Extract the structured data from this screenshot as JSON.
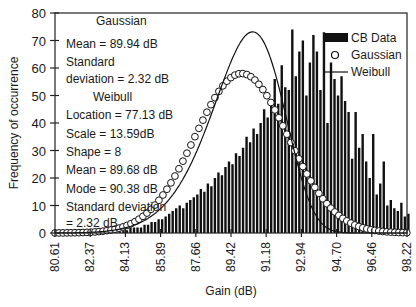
{
  "chart_data": {
    "type": "bar",
    "title": "",
    "xlabel": "Gain (dB)",
    "ylabel": "Frequency of occurrence",
    "xlim": [
      80.61,
      98.22
    ],
    "ylim": [
      0,
      80
    ],
    "grid": false,
    "legend_position": "upper right",
    "x_ticks": [
      "80.61",
      "82.37",
      "84.13",
      "85.89",
      "87.66",
      "89.42",
      "91.18",
      "92.94",
      "94.70",
      "96.46",
      "98.22"
    ],
    "y_ticks": [
      0,
      10,
      20,
      30,
      40,
      50,
      60,
      70,
      80
    ],
    "legend": [
      {
        "label": "CB Data",
        "style": "bar"
      },
      {
        "label": "Gaussian",
        "style": "circle-marker"
      },
      {
        "label": "Weibull",
        "style": "line"
      }
    ],
    "annotations": {
      "gaussian_header": "Gaussian",
      "gaussian_mean": "Mean =  89.94 dB",
      "gaussian_std_line1": "Standard",
      "gaussian_std_line2": "deviation = 2.32   dB",
      "weibull_header": "Weibull",
      "weibull_location": "Location = 77.13  dB",
      "weibull_scale": "Scale =  13.59dB",
      "weibull_shape": "Shape = 8",
      "weibull_mean": "Mean =  89.68 dB",
      "weibull_mode": "Mode = 90.38  dB",
      "weibull_std_line1": "Standard deviation",
      "weibull_std_line2": " = 2.32 dB"
    },
    "gaussian": {
      "mean": 89.94,
      "std": 2.32,
      "peak": 58
    },
    "weibull": {
      "location": 77.13,
      "scale": 13.59,
      "shape": 8,
      "mean": 89.68,
      "mode": 90.38,
      "std": 2.32,
      "peak": 73
    },
    "series": [
      {
        "name": "CB Data",
        "bin_start": 80.61,
        "bin_width": 0.176,
        "values": [
          0,
          0,
          0,
          0,
          0,
          0,
          0,
          0,
          0,
          0,
          0,
          0,
          0,
          0,
          0,
          1,
          1,
          1,
          1,
          1,
          1,
          2,
          2,
          2,
          2,
          3,
          3,
          4,
          4,
          5,
          5,
          6,
          7,
          8,
          9,
          10,
          9,
          11,
          12,
          13,
          14,
          16,
          15,
          18,
          17,
          20,
          22,
          21,
          24,
          26,
          25,
          29,
          28,
          31,
          35,
          33,
          38,
          36,
          40,
          45,
          42,
          48,
          56,
          47,
          61,
          53,
          52,
          74,
          57,
          66,
          70,
          50,
          62,
          72,
          66,
          52,
          73,
          40,
          62,
          56,
          50,
          57,
          48,
          44,
          27,
          44,
          31,
          36,
          26,
          20,
          36,
          14,
          18,
          26,
          10,
          12,
          9,
          8,
          11,
          6,
          7,
          5,
          9,
          5,
          4,
          3,
          2,
          1,
          1,
          0,
          2,
          3,
          1,
          0,
          0,
          1,
          0,
          0,
          0,
          0
        ]
      }
    ]
  }
}
